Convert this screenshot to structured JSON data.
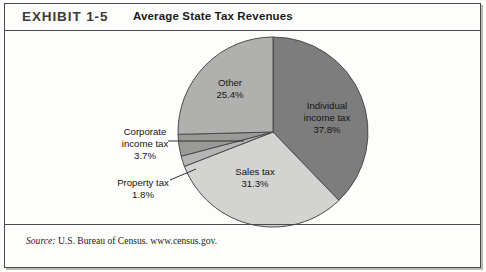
{
  "exhibit": {
    "label": "EXHIBIT 1-5",
    "title": "Average State Tax Revenues"
  },
  "source": {
    "prefix": "Source:",
    "text": " U.S. Bureau of Census. www.census.gov."
  },
  "labels": {
    "individual": "Individual\nincome tax\n37.8%",
    "individual_l1": "Individual",
    "individual_l2": "income tax",
    "individual_l3": "37.8%",
    "other_l1": "Other",
    "other_l2": "25.4%",
    "sales_l1": "Sales tax",
    "sales_l2": "31.3%",
    "corporate_l1": "Corporate",
    "corporate_l2": "income tax",
    "corporate_l3": "3.7%",
    "property_l1": "Property tax",
    "property_l2": "1.8%"
  },
  "chart_data": {
    "type": "pie",
    "title": "Average State Tax Revenues",
    "start_angle_deg": 0,
    "direction": "clockwise",
    "center": [
      273,
      132
    ],
    "radius": 95,
    "categories": [
      "Individual income tax",
      "Sales tax",
      "Property tax",
      "Corporate income tax",
      "Other"
    ],
    "values": [
      37.8,
      31.3,
      1.8,
      3.7,
      25.4
    ],
    "unit": "%",
    "colors": [
      "#7d7d7d",
      "#d3d3d1",
      "#b5b5b3",
      "#9a9a98",
      "#b0b0ae"
    ],
    "slices": [
      {
        "name": "Individual income tax",
        "value": 37.8,
        "color": "#7d7d7d",
        "label_inside": true
      },
      {
        "name": "Sales tax",
        "value": 31.3,
        "color": "#d3d3d1",
        "label_inside": true
      },
      {
        "name": "Property tax",
        "value": 1.8,
        "color": "#b5b5b3",
        "label_inside": false
      },
      {
        "name": "Corporate income tax",
        "value": 3.7,
        "color": "#9a9a98",
        "label_inside": false
      },
      {
        "name": "Other",
        "value": 25.4,
        "color": "#b0b0ae",
        "label_inside": true
      }
    ],
    "legend": "none",
    "grid": false,
    "xlabel": "",
    "ylabel": ""
  },
  "style": {
    "stroke": "#4a4a4a",
    "frame": "#4a4a4a",
    "background": "#fdfdfb"
  }
}
